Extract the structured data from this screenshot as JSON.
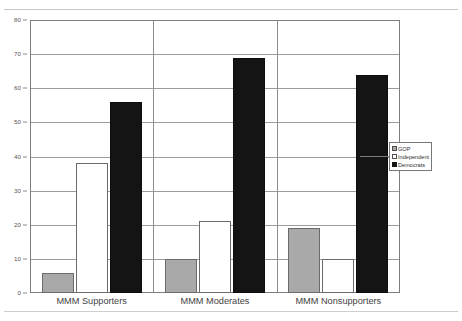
{
  "chart_data": {
    "type": "bar",
    "title": "",
    "subtitle": "",
    "xlabel": "",
    "ylabel": "",
    "ylim": [
      0,
      80
    ],
    "ytick_step": 10,
    "yticks": [
      80,
      70,
      60,
      50,
      40,
      30,
      20,
      10,
      0
    ],
    "grid": true,
    "legend_position": "right",
    "categories": [
      "MMM Supporters",
      "MMM Moderates",
      "MMM Nonsupporters"
    ],
    "series": [
      {
        "name": "GOP",
        "color": "#a9a9a9",
        "values": [
          6,
          10,
          19
        ]
      },
      {
        "name": "Independent",
        "color": "#ffffff",
        "values": [
          38,
          21,
          10
        ]
      },
      {
        "name": "Democrats",
        "color": "#141414",
        "values": [
          56,
          69,
          64
        ]
      }
    ]
  },
  "axis": {
    "y_tick_labels": [
      "80",
      "70",
      "60",
      "50",
      "40",
      "30",
      "20",
      "10",
      "0"
    ]
  },
  "legend": {
    "items": [
      {
        "label": "GOP",
        "swatch": "gop"
      },
      {
        "label": "Independent",
        "swatch": "ind"
      },
      {
        "label": "Democrats",
        "swatch": "dem"
      }
    ]
  },
  "page": {
    "top_rule_text": ""
  }
}
